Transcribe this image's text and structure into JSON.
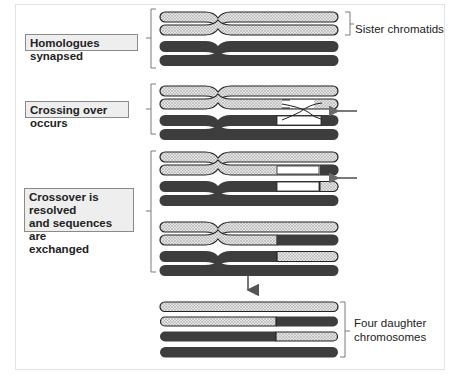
{
  "labels": {
    "homologues_synapsed": "Homologues synapsed",
    "crossing_over": "Crossing over occurs",
    "resolved_line1": "Crossover is resolved",
    "resolved_line2": "and sequences are",
    "resolved_line3": "exchanged",
    "sister_chromatids": "Sister chromatids",
    "four_daughter_line1": "Four daughter",
    "four_daughter_line2": "chromosomes"
  },
  "colors": {
    "dark_chromatid": "#3d3d3d",
    "dotted_fill": "#d9d9d9",
    "label_box_bg": "#eeeeee",
    "bracket": "#7a7a7a",
    "arrow": "#6b6b6b"
  },
  "icons": {
    "side_arrow": "arrow-left-icon",
    "down_arrow": "arrow-down-icon"
  }
}
